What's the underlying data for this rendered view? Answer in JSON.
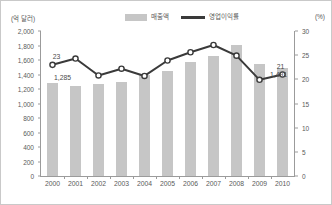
{
  "legend": {
    "items": [
      {
        "label": "매출액",
        "marker": "bar-swatch",
        "color": "#c6c6c6"
      },
      {
        "label": "영업이익률",
        "marker": "line-swatch",
        "color": "#3a3a3a"
      }
    ]
  },
  "axes": {
    "left_unit": "(억 달러)",
    "right_unit": "(%)",
    "left_ticks": [
      "2,000",
      "1,800",
      "1,600",
      "1,400",
      "1,200",
      "1,000",
      "800",
      "600",
      "400",
      "200",
      "0"
    ],
    "right_ticks": [
      "30",
      "25",
      "20",
      "15",
      "10",
      "5",
      "0"
    ]
  },
  "annotations": [
    {
      "text": "23",
      "name": "annotation-margin-2000"
    },
    {
      "text": "1,285",
      "name": "annotation-revenue-2000"
    },
    {
      "text": "21",
      "name": "annotation-margin-2010"
    },
    {
      "text": "1,491",
      "name": "annotation-revenue-2010"
    }
  ],
  "chart_data": {
    "type": "bar",
    "title": "",
    "subtitle": "",
    "xlabel": "",
    "ylabel": "(억 달러)",
    "y2label": "(%)",
    "ylim": [
      0,
      2000
    ],
    "y2lim": [
      0,
      30
    ],
    "grid": false,
    "legend_position": "top-center",
    "categories": [
      "2000",
      "2001",
      "2002",
      "2003",
      "2004",
      "2005",
      "2006",
      "2007",
      "2008",
      "2009",
      "2010"
    ],
    "series": [
      {
        "name": "매출액",
        "type": "bar",
        "axis": "left",
        "unit": "억 달러",
        "color": "#c6c6c6",
        "values": [
          1285,
          1235,
          1270,
          1300,
          1395,
          1450,
          1575,
          1650,
          1810,
          1550,
          1491
        ],
        "data_labels": {
          "2000": "1,285",
          "2010": "1,491"
        }
      },
      {
        "name": "영업이익률",
        "type": "line",
        "axis": "right",
        "unit": "%",
        "color": "#3a3a3a",
        "marker": "circle-open",
        "values": [
          23.0,
          24.3,
          20.8,
          22.2,
          20.7,
          23.9,
          25.6,
          27.1,
          24.9,
          19.9,
          21.0
        ],
        "data_labels": {
          "2000": "23",
          "2010": "21"
        }
      }
    ]
  }
}
